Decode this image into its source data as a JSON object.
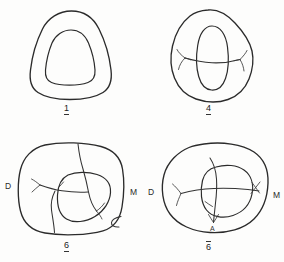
{
  "figure": {
    "type": "line-drawing-plate",
    "background_color": "#fdfdfc",
    "ink_color": "#2b2b2b",
    "panel_count": 4
  },
  "panels": [
    {
      "id": "panel-1",
      "label": "1",
      "label_style": "underline",
      "description": "rounded triangular outline with concentric inner ring",
      "orientation_left": "",
      "orientation_right": "",
      "marks": []
    },
    {
      "id": "panel-2",
      "label": "4",
      "label_style": "underline",
      "description": "rounded polygonal outline with central oval and transverse fissure with branched ends",
      "orientation_left": "",
      "orientation_right": "",
      "marks": []
    },
    {
      "id": "panel-3",
      "label": "6",
      "label_style": "underline",
      "description": "broad rounded-square outline with inner cusp loop and branching fissure network",
      "orientation_left": "D",
      "orientation_right": "M",
      "marks": []
    },
    {
      "id": "panel-4",
      "label": "6",
      "label_style": "overline",
      "description": "broad oval outline with inner cusp loop, transverse fissure and vertical fissure",
      "orientation_left": "D",
      "orientation_right": "M",
      "marks": [
        {
          "text": "A",
          "position": "bottom-center-inner"
        }
      ]
    }
  ]
}
